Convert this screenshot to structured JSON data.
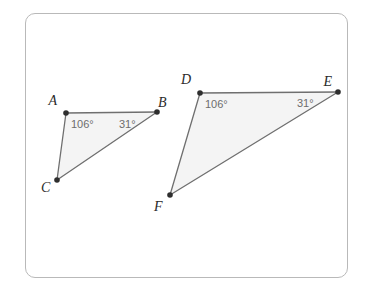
{
  "figure": {
    "frame": {
      "border_color": "#b9b9b9",
      "background_color": "#ffffff"
    },
    "style": {
      "triangle_fill": "#f4f4f4",
      "triangle_stroke": "#6f6f6f",
      "vertex_dot_color": "#2e2e2e",
      "vertex_label_color": "#2b2b2b",
      "angle_label_color": "#6d6d6d"
    },
    "triangles": [
      {
        "name": "triangle-abc",
        "vertices": [
          {
            "label": "A",
            "x": 66,
            "y": 113,
            "label_x": 57,
            "label_y": 105
          },
          {
            "label": "B",
            "x": 157,
            "y": 112,
            "label_x": 158,
            "label_y": 107
          },
          {
            "label": "C",
            "x": 57,
            "y": 180,
            "label_x": 41,
            "label_y": 192
          }
        ],
        "angles": [
          {
            "label": "106°",
            "at_vertex": "A",
            "x": 71,
            "y": 128
          },
          {
            "label": "31°",
            "at_vertex": "B",
            "x": 119,
            "y": 128
          }
        ]
      },
      {
        "name": "triangle-def",
        "vertices": [
          {
            "label": "D",
            "x": 200,
            "y": 93,
            "label_x": 191,
            "label_y": 84
          },
          {
            "label": "E",
            "x": 338,
            "y": 92,
            "label_x": 332,
            "label_y": 86
          },
          {
            "label": "F",
            "x": 170,
            "y": 195,
            "label_x": 154,
            "label_y": 211
          }
        ],
        "angles": [
          {
            "label": "106°",
            "at_vertex": "D",
            "x": 205,
            "y": 108
          },
          {
            "label": "31°",
            "at_vertex": "E",
            "x": 297,
            "y": 107
          }
        ]
      }
    ]
  }
}
